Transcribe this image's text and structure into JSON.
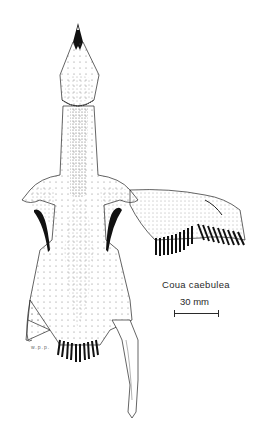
{
  "figure": {
    "species_label": "Coua caebulea",
    "scale": {
      "label": "30 mm",
      "bar_length_px": 45
    },
    "signature": "w.p.p."
  },
  "colors": {
    "ink": "#1a1a1a",
    "paper": "#ffffff",
    "dots": "#555555"
  }
}
